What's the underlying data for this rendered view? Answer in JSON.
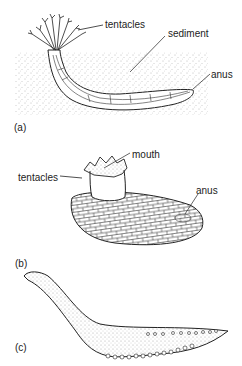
{
  "figure": {
    "panels": [
      {
        "id": "a",
        "label": "(a)",
        "annotations": [
          "tentacles",
          "sediment",
          "anus"
        ]
      },
      {
        "id": "b",
        "label": "(b)",
        "annotations": [
          "mouth",
          "tentacles",
          "anus"
        ]
      },
      {
        "id": "c",
        "label": "(c)",
        "annotations": []
      }
    ]
  },
  "labels": {
    "a_tentacles": "tentacles",
    "a_sediment": "sediment",
    "a_anus": "anus",
    "a_panel": "(a)",
    "b_mouth": "mouth",
    "b_tentacles": "tentacles",
    "b_anus": "anus",
    "b_panel": "(b)",
    "c_panel": "(c)"
  },
  "colors": {
    "ink": "#222222",
    "stipple": "#888888",
    "background": "#ffffff"
  }
}
